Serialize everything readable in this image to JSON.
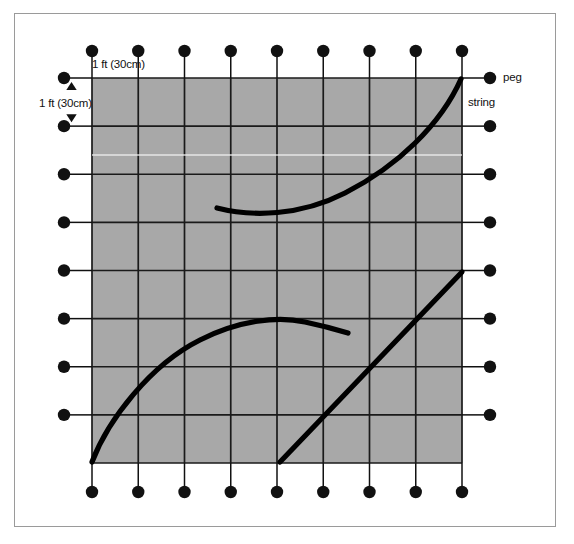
{
  "diagram": {
    "labels": {
      "top_scale": "1 ft (30cm)",
      "left_scale": "1 ft (30cm)",
      "peg": "peg",
      "string": "string"
    },
    "colors": {
      "grid_fill": "#a8a8a8",
      "grid_line": "#1a1a1a",
      "peg": "#111111",
      "string": "#000000",
      "frame_border": "#9a9a9a",
      "page_background": "#ffffff",
      "scanline": "#f2f2f2"
    },
    "grid": {
      "columns": 8,
      "rows": 8,
      "peg_columns": 9,
      "peg_rows": 9,
      "cell_size_label": "1 ft (30cm)",
      "left": 92,
      "top": 78,
      "right": 462,
      "bottom": 463,
      "cell_width": 46.25,
      "cell_height": 48.125
    },
    "pegs": {
      "top_y": 51,
      "bottom_y": 492,
      "left_x": 64,
      "right_x": 490,
      "radius": 6.2,
      "top_count": 9,
      "bottom_count": 9,
      "left_count": 8,
      "right_count": 8
    },
    "strings": [
      {
        "name": "upper-curve",
        "description": "concave curve rising to top right corner peg",
        "path": "M 217 208 C 252 217, 300 216, 345 193 C 398 166, 441 124, 461 79"
      },
      {
        "name": "lower-curve",
        "description": "arc from bottom left peg rising to a crest then falling slightly",
        "path": "M 92 462 C 108 420, 150 365, 200 340 C 240 320, 278 316, 305 322 C 324 326, 338 330, 348 333"
      },
      {
        "name": "diagonal-line",
        "description": "straight taut string from bottom edge to right edge",
        "path": "M 280 462 L 462 272"
      }
    ],
    "scanline": {
      "y": 155,
      "from_x": 92,
      "to_x": 462
    }
  }
}
